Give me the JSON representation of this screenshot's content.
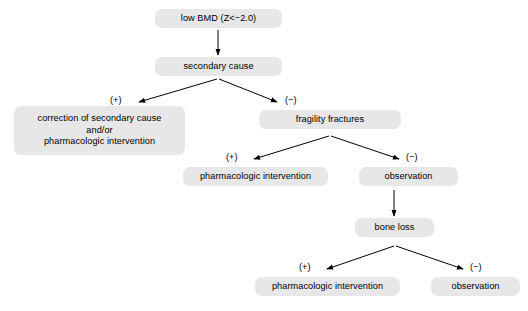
{
  "diagram": {
    "title_text": "low BMD (Z<−2.0)",
    "canvas": {
      "width": 528,
      "height": 311,
      "background": "#ffffff"
    },
    "style": {
      "node_fill": "#e7e7e7",
      "edge_color": "#000000",
      "text_color": "#000000"
    },
    "nodes": [
      {
        "id": "low-bmd",
        "lines": [
          "low BMD (Z<−2.0)"
        ],
        "x": 155,
        "y": 9,
        "w": 127,
        "h": 19
      },
      {
        "id": "secondary-cause",
        "lines": [
          "secondary cause"
        ],
        "x": 155,
        "y": 57,
        "w": 127,
        "h": 19
      },
      {
        "id": "correction-secondary-cause",
        "lines": [
          "correction of secondary cause",
          "and/or",
          "pharmacologic intervention"
        ],
        "x": 14,
        "y": 106,
        "w": 171,
        "h": 49
      },
      {
        "id": "fragility-fractures",
        "lines": [
          "fragility fractures"
        ],
        "x": 259,
        "y": 110,
        "w": 142,
        "h": 19
      },
      {
        "id": "pharmacologic-intervention-mid",
        "lines": [
          "pharmacologic intervention"
        ],
        "x": 183,
        "y": 167,
        "w": 145,
        "h": 19
      },
      {
        "id": "observation-mid",
        "lines": [
          "observation"
        ],
        "x": 359,
        "y": 167,
        "w": 99,
        "h": 19
      },
      {
        "id": "bone-loss",
        "lines": [
          "bone loss"
        ],
        "x": 355,
        "y": 218,
        "w": 79,
        "h": 19
      },
      {
        "id": "pharmacologic-intervention-bottom",
        "lines": [
          "pharmacologic intervention"
        ],
        "x": 255,
        "y": 277,
        "w": 145,
        "h": 19
      },
      {
        "id": "observation-bottom",
        "lines": [
          "observation"
        ],
        "x": 431,
        "y": 277,
        "w": 89,
        "h": 19
      }
    ],
    "signs": [
      {
        "id": "sign-plus-1",
        "label": "(+)",
        "x": 110,
        "y": 95
      },
      {
        "id": "sign-minus-1",
        "label": "(−)",
        "x": 285,
        "y": 95
      },
      {
        "id": "sign-plus-2",
        "label": "(+)",
        "x": 226,
        "y": 152
      },
      {
        "id": "sign-minus-2",
        "label": "(−)",
        "x": 406,
        "y": 152
      },
      {
        "id": "sign-plus-3",
        "label": "(+)",
        "x": 299,
        "y": 262
      },
      {
        "id": "sign-minus-3",
        "label": "(−)",
        "x": 470,
        "y": 262
      }
    ],
    "edges": [
      {
        "id": "edge-lowbmd-to-secondary",
        "kind": "vertical",
        "from": "low-bmd",
        "to": "secondary-cause",
        "x1": 218,
        "y1": 30,
        "x2": 218,
        "y2": 55
      },
      {
        "id": "edge-secondary-to-correction",
        "kind": "diagonal",
        "from": "secondary-cause",
        "to": "correction-secondary-cause",
        "x1": 217,
        "y1": 79,
        "x2": 139,
        "y2": 102
      },
      {
        "id": "edge-secondary-to-fragility",
        "kind": "diagonal",
        "from": "secondary-cause",
        "to": "fragility-fractures",
        "x1": 219,
        "y1": 79,
        "x2": 277,
        "y2": 102
      },
      {
        "id": "edge-fragility-to-pharm-mid",
        "kind": "diagonal",
        "from": "fragility-fractures",
        "to": "pharmacologic-intervention-mid",
        "x1": 329,
        "y1": 136,
        "x2": 254,
        "y2": 159
      },
      {
        "id": "edge-fragility-to-observation-mid",
        "kind": "diagonal",
        "from": "fragility-fractures",
        "to": "observation-mid",
        "x1": 331,
        "y1": 136,
        "x2": 399,
        "y2": 159
      },
      {
        "id": "edge-observation-to-boneloss",
        "kind": "vertical",
        "from": "observation-mid",
        "to": "bone-loss",
        "x1": 394,
        "y1": 190,
        "x2": 394,
        "y2": 216
      },
      {
        "id": "edge-boneloss-to-pharm-bottom",
        "kind": "diagonal",
        "from": "bone-loss",
        "to": "pharmacologic-intervention-bottom",
        "x1": 394,
        "y1": 246,
        "x2": 327,
        "y2": 269
      },
      {
        "id": "edge-boneloss-to-observation-bottom",
        "kind": "diagonal",
        "from": "bone-loss",
        "to": "observation-bottom",
        "x1": 396,
        "y1": 246,
        "x2": 463,
        "y2": 269
      }
    ]
  }
}
